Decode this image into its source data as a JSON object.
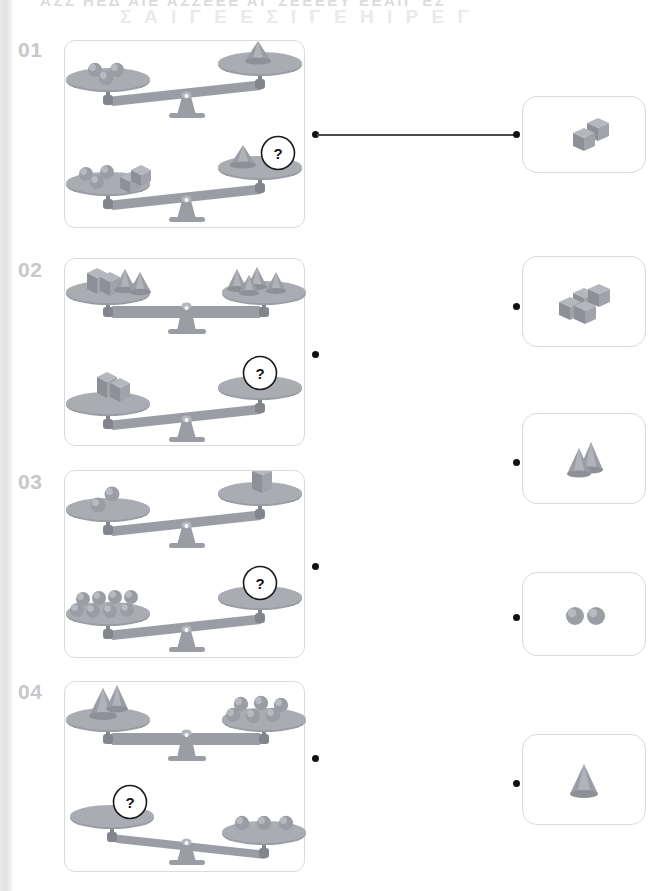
{
  "page": {
    "width": 671,
    "height": 891,
    "header_ghost_top": "ΑΣΣ ΗΕΔ ΑΙΕ ΑΣΣΕΕΕ    ΑΓ ΣΕΕΕΕΥ  ΕΕΑΙΓ  ΕΣ",
    "header_ghost_second": "Σ Α Ι Γ Ε Ε Σ Ι Γ Ε Η Ι Ρ Ε Γ",
    "background_color": "#ffffff",
    "card_border_color": "#d8dadc",
    "shape_fill_color": "#9a9ea4",
    "shape_light_color": "#b4b8bd",
    "shape_dark_color": "#82868c",
    "number_color": "#c6c8ca",
    "arrow_color": "#e3e5e7",
    "dot_color": "#111111",
    "connector_color": "#4a4a4a"
  },
  "puzzles": [
    {
      "number": "01",
      "question_mark": "?",
      "top_equation": {
        "left": "3 spheres",
        "right": "1 cone",
        "left_count": 3,
        "right_count": 1
      },
      "bottom_equation": {
        "left": "3 spheres + 2 cubes",
        "right": "1 cone + ?",
        "left_count": 5,
        "right_count": 1
      },
      "answer_linked_to_option": 1
    },
    {
      "number": "02",
      "question_mark": "?",
      "top_equation": {
        "left": "2 cubes + 2 cones",
        "right": "4 cones",
        "left_count": 4,
        "right_count": 4
      },
      "bottom_equation": {
        "left": "2 cubes",
        "right": "?",
        "left_count": 2,
        "right_count": 0
      },
      "answer_linked_to_option": null
    },
    {
      "number": "03",
      "question_mark": "?",
      "top_equation": {
        "left": "2 spheres",
        "right": "1 cube",
        "left_count": 2,
        "right_count": 1
      },
      "bottom_equation": {
        "left": "8 spheres",
        "right": "?",
        "left_count": 8,
        "right_count": 0
      },
      "answer_linked_to_option": null
    },
    {
      "number": "04",
      "question_mark": "?",
      "top_equation": {
        "left": "2 cones",
        "right": "6 spheres",
        "left_count": 2,
        "right_count": 6
      },
      "bottom_equation": {
        "left": "?",
        "right": "3 spheres",
        "left_count": 0,
        "right_count": 3
      },
      "answer_linked_to_option": null
    }
  ],
  "options": [
    {
      "id": "option-1",
      "label": "two cubes",
      "shape": "cube",
      "count": 2,
      "arrangement": "diagonal-pair"
    },
    {
      "id": "option-2",
      "label": "four cubes",
      "shape": "cube",
      "count": 4,
      "arrangement": "staggered-cluster"
    },
    {
      "id": "option-3",
      "label": "two cones",
      "shape": "cone",
      "count": 2,
      "arrangement": "overlapping-pair"
    },
    {
      "id": "option-4",
      "label": "two spheres",
      "shape": "sphere",
      "count": 2,
      "arrangement": "side-by-side"
    },
    {
      "id": "option-5",
      "label": "one cone",
      "shape": "cone",
      "count": 1,
      "arrangement": "single"
    }
  ]
}
